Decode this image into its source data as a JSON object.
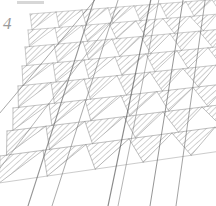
{
  "figure": {
    "number_label": "4",
    "caption": "",
    "medium": "scanned line drawing",
    "background_color": "#ffffff",
    "ink_color": "#8c8c8c",
    "dark_line_color": "#5a5a5a",
    "hatch_color": "#a8a8a8",
    "width_px": 216,
    "height_px": 206
  },
  "artifacts": {
    "top_edge_smudge": {
      "label": "scan-edge-smudge",
      "x": 17,
      "y": 1,
      "width": 27,
      "height": 3,
      "color": "#c9c9c9"
    }
  },
  "chart_data": {
    "type": "diagram",
    "title": "4",
    "subtitle": "",
    "xlabel": "",
    "ylabel": "",
    "grid": false,
    "legend": "none",
    "lattice": {
      "structure": "triangulated strip tessellation in perspective",
      "row_count": 9,
      "columns_per_row": 7,
      "row_baselines_y": [
        14,
        30,
        47,
        66,
        86,
        108,
        131,
        156,
        184
      ],
      "row_left_offsets_x": [
        30,
        28,
        25,
        22,
        18,
        13,
        7,
        0,
        -8
      ],
      "row_right_x": [
        216,
        216,
        216,
        216,
        216,
        216,
        216,
        216,
        216
      ],
      "row_tilt_degrees": [
        -4.5,
        -4.8,
        -5.2,
        -5.6,
        -6.0,
        -6.5,
        -7.0,
        -7.6,
        -8.2
      ],
      "cell_width_px": [
        26,
        27,
        29,
        31,
        33,
        36,
        39,
        43,
        48
      ],
      "hatch_parity": "alternating: downward-pointing triangles are hatched",
      "hatch_angle_degrees": 45,
      "hatch_spacing_px": 1.6
    },
    "guide_lines": [
      {
        "name": "guide-line-1",
        "x1": 28,
        "y1": 206,
        "x2": 96,
        "y2": -6,
        "weight": 1.1,
        "color": "#6a6a6a"
      },
      {
        "name": "guide-line-2",
        "x1": 52,
        "y1": 206,
        "x2": 120,
        "y2": -6,
        "weight": 0.9,
        "color": "#7a7a7a"
      },
      {
        "name": "guide-line-3",
        "x1": 108,
        "y1": 206,
        "x2": 152,
        "y2": -6,
        "weight": 1.2,
        "color": "#5a5a5a"
      },
      {
        "name": "guide-line-4",
        "x1": 118,
        "y1": 206,
        "x2": 160,
        "y2": -6,
        "weight": 0.8,
        "color": "#7a7a7a"
      },
      {
        "name": "guide-line-5",
        "x1": 150,
        "y1": 206,
        "x2": 184,
        "y2": -6,
        "weight": 1.0,
        "color": "#6a6a6a"
      },
      {
        "name": "guide-line-6",
        "x1": 176,
        "y1": 206,
        "x2": 206,
        "y2": -6,
        "weight": 0.9,
        "color": "#6f6f6f"
      },
      {
        "name": "guide-line-7",
        "x1": -6,
        "y1": 120,
        "x2": 100,
        "y2": -6,
        "weight": 0.9,
        "color": "#787878"
      },
      {
        "name": "guide-line-8",
        "x1": -6,
        "y1": 176,
        "x2": 120,
        "y2": 10,
        "weight": 0.8,
        "color": "#808080"
      }
    ]
  }
}
